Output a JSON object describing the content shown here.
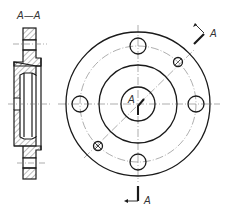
{
  "drawing": {
    "type": "engineering drawing - flange",
    "section_label": "A—A",
    "cut_marker_top_label": "A",
    "cut_marker_bottom_label": "A",
    "center_label": "A",
    "line_color": "#1a1a1a",
    "hatch_color": "#555555",
    "center_line_color": "#777777"
  },
  "front_view": {
    "center": [
      138,
      104
    ],
    "outer_radius": 72,
    "bolt_circle_radius": 58,
    "raised_face_radius": 39,
    "bore_radius": 17,
    "bolt_hole_radius": 8,
    "pin_hole_radius": 5,
    "bolt_hole_count": 4,
    "pin_hole_count": 2
  }
}
